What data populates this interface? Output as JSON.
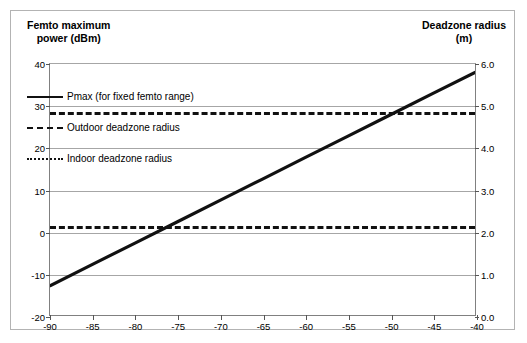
{
  "left_axis_title": "Femto maximum\npower (dBm)",
  "right_axis_title": "Deadzone radius\n(m)",
  "legend": [
    {
      "style": "solid",
      "label": "Pmax (for fixed femto range)"
    },
    {
      "style": "dash-long",
      "label": "Outdoor deadzone radius"
    },
    {
      "style": "dash-short",
      "label": "Indoor deadzone radius"
    }
  ],
  "chart_data": {
    "type": "line",
    "title": "",
    "xlabel": "",
    "ylabel": "Femto maximum power (dBm)",
    "y2label": "Deadzone radius (m)",
    "grid": true,
    "legend_position": "inside-left",
    "xlim": [
      -90,
      -40
    ],
    "ylim": [
      -20,
      40
    ],
    "y2lim": [
      0.0,
      6.0
    ],
    "xticks": [
      -90,
      -85,
      -80,
      -75,
      -70,
      -65,
      -60,
      -55,
      -50,
      -45,
      -40
    ],
    "xticklabels": [
      "-90",
      "-85",
      "-80",
      "-75",
      "-70",
      "-65",
      "-60",
      "-55",
      "-50",
      "-45",
      "-40"
    ],
    "yticks": [
      -20,
      -10,
      0,
      10,
      20,
      30,
      40
    ],
    "yticklabels": [
      "-20",
      "-10",
      "0",
      "10",
      "20",
      "30",
      "40"
    ],
    "y2ticks": [
      0.0,
      1.0,
      2.0,
      3.0,
      4.0,
      5.0,
      6.0
    ],
    "y2ticklabels": [
      "0.0",
      "1.0",
      "2.0",
      "3.0",
      "4.0",
      "5.0",
      "6.0"
    ],
    "series": [
      {
        "name": "Pmax (for fixed femto range)",
        "style": "solid",
        "axis": "left",
        "x": [
          -90,
          -85,
          -80,
          -75,
          -70,
          -65,
          -60,
          -55,
          -50,
          -45,
          -40
        ],
        "values": [
          -13.0,
          -7.9,
          -2.8,
          2.3,
          7.4,
          12.5,
          17.6,
          22.7,
          27.8,
          32.9,
          38.0
        ]
      },
      {
        "name": "Outdoor deadzone radius",
        "style": "dash-long",
        "axis": "right",
        "constant_left": 28.5,
        "constant_right": 4.85,
        "x": [
          -90,
          -40
        ],
        "values": [
          4.85,
          4.85
        ]
      },
      {
        "name": "Indoor deadzone radius",
        "style": "dash-short",
        "axis": "right",
        "constant_left": 1.6,
        "constant_right": 2.16,
        "x": [
          -90,
          -40
        ],
        "values": [
          2.16,
          2.16
        ]
      }
    ]
  }
}
